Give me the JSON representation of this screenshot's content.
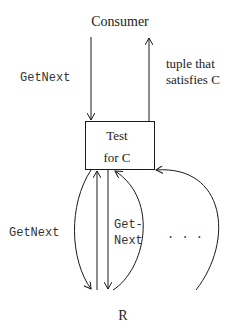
{
  "diagram": {
    "consumer_label": "Consumer",
    "getnext_top_label": "GetNext",
    "tuple_label_line1": "tuple that",
    "tuple_label_line2": "satisfies C",
    "box_line1": "Test",
    "box_line2": "for C",
    "getnext_left_label": "GetNext",
    "getnext_mid_line1": "Get-",
    "getnext_mid_line2": "Next",
    "ellipsis": ". . .",
    "relation_label": "R"
  },
  "colors": {
    "stroke": "#1a1a1a",
    "background": "#ffffff"
  }
}
